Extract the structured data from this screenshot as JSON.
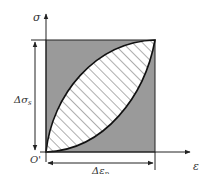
{
  "diagram": {
    "axes": {
      "y_label": "σ",
      "x_label": "ε",
      "origin_label": "O'"
    },
    "dimensions": {
      "stress_range_label": "Δσ",
      "stress_range_subscript": "s",
      "strain_range_label": "Δε",
      "strain_range_subscript": "p"
    },
    "colors": {
      "box_fill": "#9a9a9a",
      "loop_fill": "#ffffff",
      "hatch": "#9a9a9a",
      "line": "#222222"
    }
  }
}
